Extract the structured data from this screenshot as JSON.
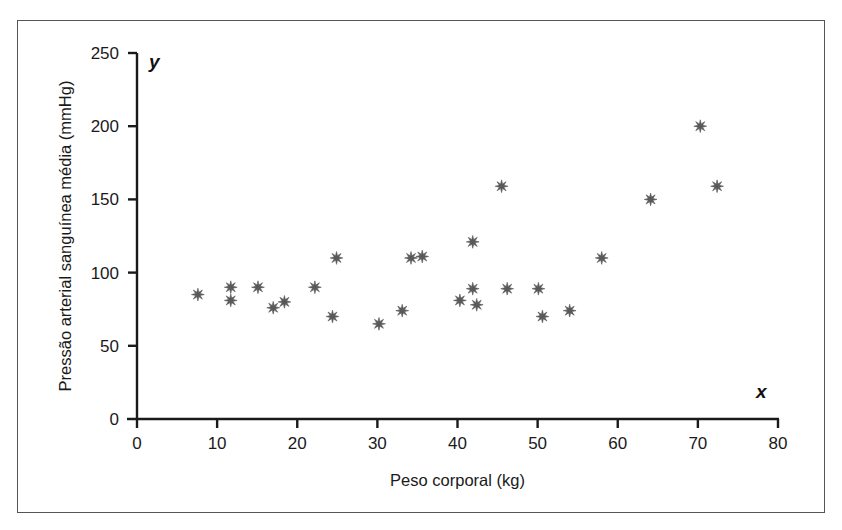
{
  "figure": {
    "background_color": "#ffffff",
    "frame_color": "#555555",
    "marker_color": "#595959",
    "axis_color": "#1a1a1a"
  },
  "chart_data": {
    "type": "scatter",
    "title": "",
    "xlabel": "Peso corporal (kg)",
    "ylabel": "Pressão arterial sanguínea média (mmHg)",
    "x_axis_letter": "x",
    "y_axis_letter": "y",
    "xlim": [
      0,
      80
    ],
    "ylim": [
      0,
      250
    ],
    "xticks": [
      0,
      10,
      20,
      30,
      40,
      50,
      60,
      70,
      80
    ],
    "yticks": [
      0,
      50,
      100,
      150,
      200,
      250
    ],
    "xtick_labels": [
      "0",
      "10",
      "20",
      "30",
      "40",
      "50",
      "60",
      "70",
      "80"
    ],
    "ytick_labels": [
      "0",
      "50",
      "100",
      "150",
      "200",
      "250"
    ],
    "grid": false,
    "legend": false,
    "marker": "star-8-point",
    "series": [
      {
        "name": "Peso corporal vs Pressão arterial",
        "points": [
          [
            7.6,
            85
          ],
          [
            11.7,
            90
          ],
          [
            11.7,
            81
          ],
          [
            15.1,
            90
          ],
          [
            17.0,
            76
          ],
          [
            18.4,
            80
          ],
          [
            22.2,
            90
          ],
          [
            24.9,
            110
          ],
          [
            24.4,
            70
          ],
          [
            30.2,
            65
          ],
          [
            33.1,
            74
          ],
          [
            34.2,
            110
          ],
          [
            35.6,
            111
          ],
          [
            40.3,
            81
          ],
          [
            41.9,
            89
          ],
          [
            41.9,
            121
          ],
          [
            42.4,
            78
          ],
          [
            45.5,
            159
          ],
          [
            46.2,
            89
          ],
          [
            50.1,
            89
          ],
          [
            50.6,
            70
          ],
          [
            54.0,
            74
          ],
          [
            58.0,
            110
          ],
          [
            64.1,
            150
          ],
          [
            70.3,
            200
          ],
          [
            72.4,
            159
          ]
        ]
      }
    ]
  }
}
